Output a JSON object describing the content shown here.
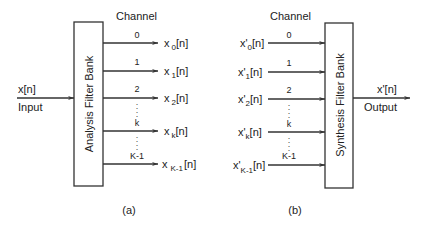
{
  "colors": {
    "stroke": "#333333",
    "text": "#222222",
    "background": "#ffffff"
  },
  "panel_a": {
    "channel_heading": "Channel",
    "block_label": "Analysis Filter Bank",
    "input_signal": "x[n]",
    "input_label": "Input",
    "channels": [
      {
        "index": "0",
        "out_base": "x",
        "out_sub": "0",
        "out_tail": "[n]"
      },
      {
        "index": "1",
        "out_base": "x",
        "out_sub": "1",
        "out_tail": "[n]"
      },
      {
        "index": "2",
        "out_base": "x",
        "out_sub": "2",
        "out_tail": "[n]"
      },
      {
        "index": "k",
        "out_base": "x",
        "out_sub": "k",
        "out_tail": "[n]"
      },
      {
        "index": "K-1",
        "out_base": "x",
        "out_sub": "K-1",
        "out_tail": "[n]"
      }
    ],
    "caption": "(a)"
  },
  "panel_b": {
    "channel_heading": "Channel",
    "block_label": "Synthesis Filter Bank",
    "output_signal": "x'[n]",
    "output_label": "Output",
    "channels": [
      {
        "index": "0",
        "in_base": "x'",
        "in_sub": "0",
        "in_tail": "[n]"
      },
      {
        "index": "1",
        "in_base": "x'",
        "in_sub": "1",
        "in_tail": "[n]"
      },
      {
        "index": "2",
        "in_base": "x'",
        "in_sub": "2",
        "in_tail": "[n]"
      },
      {
        "index": "k",
        "in_base": "x'",
        "in_sub": "k",
        "in_tail": "[n]"
      },
      {
        "index": "K-1",
        "in_base": "x'",
        "in_sub": "K-1",
        "in_tail": "[n]"
      }
    ],
    "caption": "(b)"
  },
  "ellipsis": ":"
}
